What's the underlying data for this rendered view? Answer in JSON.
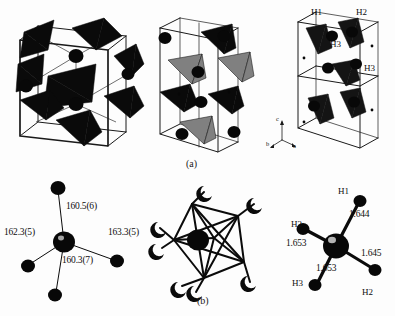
{
  "figure": {
    "background_color": "#fdfdfd",
    "ink_color": "#0a0a0a",
    "accent_gray": "#808080"
  },
  "captions": {
    "panel_a": "(a)",
    "panel_b": "(b)"
  },
  "panel_a": {
    "cell_left": {
      "name": "unit-cell-left",
      "polyhedra_color": "#0a0a0a",
      "sphere_color": "#080808"
    },
    "cell_middle": {
      "name": "unit-cell-middle",
      "polyhedra_dark_color": "#0a0a0a",
      "polyhedra_gray_color": "#808080"
    },
    "cell_right": {
      "name": "unit-cell-right",
      "atom_labels": [
        {
          "text": "H1",
          "x": 311,
          "y": 13
        },
        {
          "text": "H2",
          "x": 356,
          "y": 13
        },
        {
          "text": "H3",
          "x": 330,
          "y": 44
        },
        {
          "text": "H3",
          "x": 364,
          "y": 68
        }
      ],
      "axes": {
        "name": "crystal-axis-triad",
        "labels": [
          {
            "text": "c",
            "x": 276,
            "y": 120
          },
          {
            "text": "b",
            "x": 269,
            "y": 143
          },
          {
            "text": "a",
            "x": 293,
            "y": 147
          }
        ]
      }
    }
  },
  "panel_b": {
    "angles_diagram": {
      "name": "bond-angle-diagram",
      "labels": [
        {
          "text": "160.5(6)",
          "x": 66,
          "y": 206
        },
        {
          "text": "162.3(5)",
          "x": 5,
          "y": 232
        },
        {
          "text": "163.3(5)",
          "x": 108,
          "y": 232
        },
        {
          "text": "160.3(7)",
          "x": 62,
          "y": 260
        }
      ]
    },
    "cage_diagram": {
      "name": "polyhedral-cage-diagram",
      "center_atom_color": "#0a0a0a",
      "vertex_count": 9
    },
    "bond_length_diagram": {
      "name": "bond-length-diagram",
      "atom_labels": [
        {
          "text": "H1",
          "x": 340,
          "y": 192
        },
        {
          "text": "H2",
          "x": 362,
          "y": 292
        },
        {
          "text": "H3",
          "x": 293,
          "y": 224
        },
        {
          "text": "H3",
          "x": 294,
          "y": 276
        }
      ],
      "distance_labels": [
        {
          "text": "1.644",
          "x": 349,
          "y": 214
        },
        {
          "text": "1.653",
          "x": 288,
          "y": 242
        },
        {
          "text": "1.645",
          "x": 362,
          "y": 252
        },
        {
          "text": "1.653",
          "x": 318,
          "y": 267
        }
      ]
    }
  }
}
